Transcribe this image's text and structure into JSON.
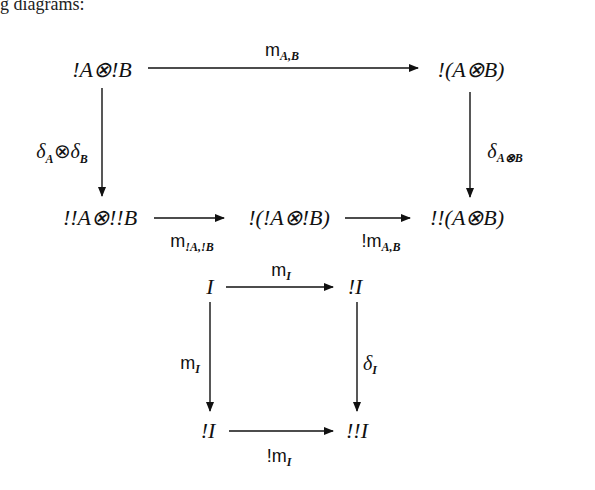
{
  "page": {
    "top_fragment": "g diagrams:"
  },
  "diagram1": {
    "nodes": {
      "top_left": "!A⊗!B",
      "top_right": "!(A⊗B)",
      "bottom_left": "!!A⊗!!B",
      "bottom_middle": "!(!A⊗!B)",
      "bottom_right": "!!(A⊗B)"
    },
    "arrows": {
      "top": {
        "base": "m",
        "sub": "A,B"
      },
      "left": {
        "base": "δ",
        "sub1": "A",
        "mid": "⊗",
        "base2": "δ",
        "sub2": "B"
      },
      "right": {
        "base": "δ",
        "sub": "A⊗B"
      },
      "bottom_first": {
        "base": "m",
        "sub": "!A,!B"
      },
      "bottom_second": {
        "prefix": "!",
        "base": "m",
        "sub": "A,B"
      }
    }
  },
  "diagram2": {
    "nodes": {
      "top_left": "I",
      "top_right": "!I",
      "bottom_left": "!I",
      "bottom_right": "!!I"
    },
    "arrows": {
      "top": {
        "base": "m",
        "sub": "I"
      },
      "left": {
        "base": "m",
        "sub": "I"
      },
      "right": {
        "base": "δ",
        "sub": "I"
      },
      "bottom": {
        "prefix": "!",
        "base": "m",
        "sub": "I"
      }
    }
  },
  "colors": {
    "ink": "#111111",
    "background": "#ffffff"
  }
}
